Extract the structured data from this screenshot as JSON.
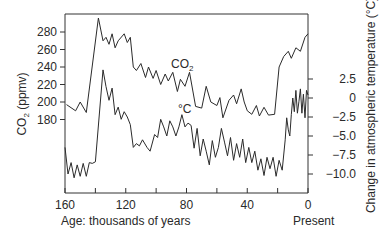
{
  "chart_data": {
    "type": "line",
    "title": "",
    "xlabel": "Age: thousands of years",
    "x_end_label": "Present",
    "x_ticks": [
      160,
      120,
      80,
      40,
      0
    ],
    "xlim": [
      160,
      0
    ],
    "left_axis": {
      "label": "CO2 (ppmv)",
      "label_main": "CO",
      "label_sub": "2",
      "label_tail": " (ppmv)",
      "ticks": [
        280,
        260,
        240,
        220,
        200,
        180
      ]
    },
    "right_axis": {
      "label": "Change in atmospheric temperature (°C)",
      "ticks": [
        "2.5",
        "0",
        "−2.5",
        "−5.0",
        "−7.5",
        "−10.0"
      ],
      "tick_values": [
        2.5,
        0,
        -2.5,
        -5.0,
        -7.5,
        -10.0
      ]
    },
    "grid": false,
    "legend": "inline labels",
    "series": [
      {
        "name": "CO2",
        "inline_label": "CO",
        "inline_label_sub": "2",
        "axis": "left",
        "x": [
          159,
          153,
          150,
          146,
          138,
          135,
          133,
          131,
          129,
          127,
          125,
          121,
          119,
          117,
          115,
          113,
          110,
          107,
          105,
          102,
          100,
          97,
          94,
          92,
          89,
          86,
          84,
          81,
          78,
          74,
          70,
          67,
          64,
          60,
          58,
          56,
          52,
          49,
          47,
          44,
          42,
          40,
          37,
          34,
          32,
          29,
          26,
          22,
          19,
          16,
          13,
          11,
          8,
          5,
          2,
          0
        ],
        "values": [
          197,
          190,
          200,
          188,
          296,
          270,
          274,
          266,
          278,
          262,
          270,
          278,
          268,
          274,
          240,
          236,
          244,
          228,
          240,
          227,
          236,
          220,
          232,
          224,
          234,
          212,
          226,
          218,
          234,
          195,
          193,
          218,
          200,
          196,
          205,
          182,
          202,
          208,
          198,
          215,
          200,
          190,
          186,
          196,
          184,
          194,
          185,
          186,
          240,
          252,
          258,
          250,
          262,
          258,
          274,
          278
        ]
      },
      {
        "name": "Temperature change (°C)",
        "inline_label": "°C",
        "axis": "right",
        "x": [
          160,
          158,
          156,
          154,
          152,
          150,
          148,
          146,
          144,
          142,
          140,
          135,
          133,
          131,
          129,
          127,
          125,
          123,
          121,
          119,
          117,
          115,
          113,
          111,
          109,
          106,
          104,
          101,
          99,
          97,
          95,
          93,
          91,
          89,
          87,
          85,
          83,
          81,
          79,
          77,
          75,
          73,
          71,
          69,
          67,
          65,
          63,
          61,
          59,
          57,
          55,
          53,
          51,
          49,
          47,
          45,
          43,
          41,
          39,
          37,
          35,
          33,
          31,
          29,
          27,
          25,
          23,
          21,
          19,
          17,
          15,
          14,
          13,
          12,
          11,
          10,
          9,
          8,
          7,
          6,
          5,
          4,
          3,
          2,
          1,
          0
        ],
        "values": [
          -6.5,
          -10.0,
          -8.5,
          -10.5,
          -8.8,
          -10.3,
          -8.6,
          -10.3,
          -8.5,
          -8.6,
          -8.4,
          3.7,
          1.5,
          -0.3,
          1.3,
          -2.2,
          -1.2,
          -2.8,
          -1.8,
          -2.5,
          -3.5,
          -6.5,
          -6.0,
          -6.3,
          -5.5,
          -6.5,
          -7.0,
          -4.8,
          -5.2,
          -2.8,
          -3.8,
          -5.0,
          -3.0,
          -3.8,
          -5.0,
          -3.8,
          -2.2,
          -3.8,
          -3.3,
          -3.6,
          -6.6,
          -4.0,
          -7.6,
          -5.4,
          -7.0,
          -8.8,
          -5.6,
          -7.8,
          -6.5,
          -4.0,
          -5.8,
          -7.6,
          -5.2,
          -8.2,
          -6.0,
          -7.8,
          -5.4,
          -8.5,
          -6.5,
          -8.5,
          -7.0,
          -9.5,
          -8.0,
          -10.2,
          -7.8,
          -9.3,
          -7.8,
          -10.3,
          -8.2,
          -9.5,
          -5.5,
          -2.6,
          -4.2,
          -5.0,
          -2.2,
          0.0,
          -1.8,
          1.0,
          -2.0,
          -0.5,
          1.2,
          -2.0,
          0.5,
          -2.6,
          1.0,
          0.4
        ]
      }
    ]
  },
  "layout": {
    "plot_left": 65,
    "plot_right": 308,
    "plot_top": 14,
    "plot_bottom": 193,
    "co2_y_at_280": 32,
    "co2_px_per_unit": 0.875,
    "temp_y_at_0": 98,
    "temp_px_per_unit": 7.6
  }
}
